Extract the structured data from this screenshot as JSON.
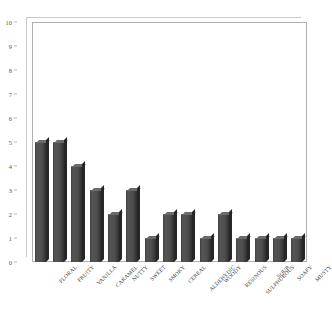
{
  "chart_data": {
    "type": "bar",
    "title": "",
    "xlabel": "",
    "ylabel": "",
    "ylim": [
      0,
      10
    ],
    "grid": false,
    "legend": "none",
    "bar_color": "#4e4e4e",
    "categories": [
      "FLORAL",
      "FRUITY",
      "VANILLA",
      "CARAMEL",
      "NUTTY",
      "SWEET",
      "SMOKY",
      "CEREAL",
      "ALDEHYDIC",
      "WOODY",
      "RESINOUS",
      "SULPHUROUS",
      "SOUR",
      "SOAPY",
      "MUSTY"
    ],
    "values": [
      5,
      5,
      4,
      3,
      2,
      3,
      1,
      2,
      2,
      1,
      2,
      1,
      1,
      1,
      1
    ],
    "yticks": [
      0,
      1,
      2,
      3,
      4,
      5,
      6,
      7,
      8,
      9,
      10
    ],
    "ytick_labels": [
      "0",
      "1",
      "2",
      "3",
      "4",
      "5",
      "6",
      "7",
      "8",
      "9",
      "10"
    ]
  }
}
